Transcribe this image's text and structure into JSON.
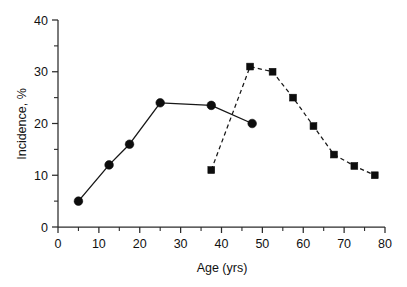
{
  "chart_data": {
    "type": "line",
    "title": "",
    "subtitle": "",
    "xlabel": "Age (yrs)",
    "ylabel": "Incidence, %",
    "xlim": [
      0,
      80
    ],
    "ylim": [
      0,
      40
    ],
    "x_ticks": [
      0,
      10,
      20,
      30,
      40,
      50,
      60,
      70,
      80
    ],
    "x_tick_labels": [
      "0",
      "10",
      "20",
      "30",
      "40",
      "50",
      "60",
      "70",
      "80"
    ],
    "x_minor_ticks": [
      5,
      15,
      25,
      35,
      45,
      55,
      65,
      75
    ],
    "y_ticks": [
      0,
      10,
      20,
      30,
      40
    ],
    "y_tick_labels": [
      "0",
      "10",
      "20",
      "30",
      "40"
    ],
    "y_minor_ticks": [
      5,
      15,
      25,
      35
    ],
    "grid": false,
    "legend": "none",
    "series": [
      {
        "name": "solid-circle-series",
        "marker": "circle",
        "linestyle": "solid",
        "color": "#111111",
        "x": [
          5,
          12.5,
          17.5,
          25,
          37.5,
          47.5
        ],
        "y": [
          5,
          12,
          16,
          24,
          23.5,
          20
        ]
      },
      {
        "name": "dashed-square-series",
        "marker": "square",
        "linestyle": "dashed",
        "color": "#111111",
        "x": [
          37.5,
          47,
          52.5,
          57.5,
          62.5,
          67.5,
          72.5,
          77.5
        ],
        "y": [
          11,
          31,
          30,
          25,
          19.5,
          14,
          11.8,
          10
        ]
      }
    ]
  }
}
